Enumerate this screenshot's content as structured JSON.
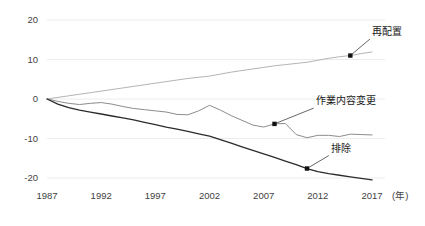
{
  "chart_data": {
    "type": "line",
    "title": "",
    "subtitle": "",
    "xlabel": "(年)",
    "ylabel": "",
    "xlim": [
      1987,
      2018.2
    ],
    "ylim": [
      -20,
      20
    ],
    "grid": true,
    "legend_position": "inline-annotations",
    "x_ticks": [
      "1987",
      "1992",
      "1997",
      "2002",
      "2007",
      "2012",
      "2017"
    ],
    "x_tick_values": [
      1987,
      1992,
      1997,
      2002,
      2007,
      2012,
      2017
    ],
    "y_ticks": [
      "20",
      "10",
      "0",
      "-10",
      "-20"
    ],
    "y_tick_values": [
      20,
      10,
      0,
      -10,
      -20
    ],
    "x": [
      1987,
      1988,
      1989,
      1990,
      1991,
      1992,
      1993,
      1994,
      1995,
      1996,
      1997,
      1998,
      1999,
      2000,
      2001,
      2002,
      2003,
      2004,
      2005,
      2006,
      2007,
      2008,
      2009,
      2010,
      2011,
      2012,
      2013,
      2014,
      2015,
      2016,
      2017
    ],
    "series": [
      {
        "name": "再配置",
        "color": "#b4b4b4",
        "width": 1.0,
        "values": [
          0,
          0.4,
          0.8,
          1.2,
          1.6,
          2.0,
          2.4,
          2.8,
          3.2,
          3.6,
          4.0,
          4.4,
          4.8,
          5.2,
          5.5,
          5.8,
          6.3,
          6.8,
          7.2,
          7.6,
          8.0,
          8.4,
          8.7,
          9.0,
          9.3,
          9.8,
          10.3,
          10.7,
          11.0,
          11.5,
          11.9
        ],
        "marker": {
          "x": 2015,
          "y": 11.0
        },
        "label_point": {
          "x": 2017.0,
          "y": 16.2
        }
      },
      {
        "name": "作業内容変更",
        "color": "#8c8c8c",
        "width": 1.0,
        "values": [
          0,
          -0.6,
          -1.1,
          -1.4,
          -1.1,
          -0.9,
          -1.3,
          -1.9,
          -2.4,
          -2.7,
          -3.0,
          -3.3,
          -3.9,
          -4.0,
          -3.0,
          -1.6,
          -2.8,
          -4.2,
          -5.4,
          -6.6,
          -7.1,
          -6.3,
          -6.2,
          -9.0,
          -9.8,
          -9.2,
          -9.2,
          -9.5,
          -8.9,
          -9.0,
          -9.1
        ],
        "marker": {
          "x": 2008,
          "y": -6.3
        },
        "label_point": {
          "x": 2011.8,
          "y": -1.3
        }
      },
      {
        "name": "排除",
        "color": "#2b2b2b",
        "width": 1.3,
        "values": [
          0,
          -1.3,
          -2.2,
          -2.8,
          -3.3,
          -3.8,
          -4.3,
          -4.8,
          -5.3,
          -5.9,
          -6.5,
          -7.1,
          -7.6,
          -8.2,
          -8.8,
          -9.4,
          -10.3,
          -11.2,
          -12.1,
          -13.0,
          -13.9,
          -14.8,
          -15.7,
          -16.6,
          -17.6,
          -18.4,
          -18.9,
          -19.3,
          -19.7,
          -20.1,
          -20.5
        ],
        "marker": {
          "x": 2011,
          "y": -17.6
        },
        "label_point": {
          "x": 2013.2,
          "y": -13.3
        }
      }
    ]
  }
}
